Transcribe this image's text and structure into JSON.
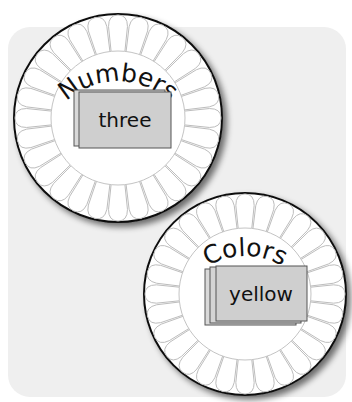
{
  "colors": {
    "panel_bg": "#efefef",
    "plate_fill": "#ffffff",
    "plate_stroke": "#111111",
    "petal_stroke": "#bdbdbd",
    "card_fill": "#cfcfcf",
    "card_back_fill": "#d9d9d9",
    "card_stroke": "#555555"
  },
  "spinners": [
    {
      "label": "Numbers",
      "card_text": "three",
      "card_count": 2,
      "center": [
        118,
        118
      ],
      "radius": 104
    },
    {
      "label": "Colors",
      "card_text": "yellow",
      "card_count": 3,
      "center": [
        245,
        294
      ],
      "radius": 101
    }
  ]
}
